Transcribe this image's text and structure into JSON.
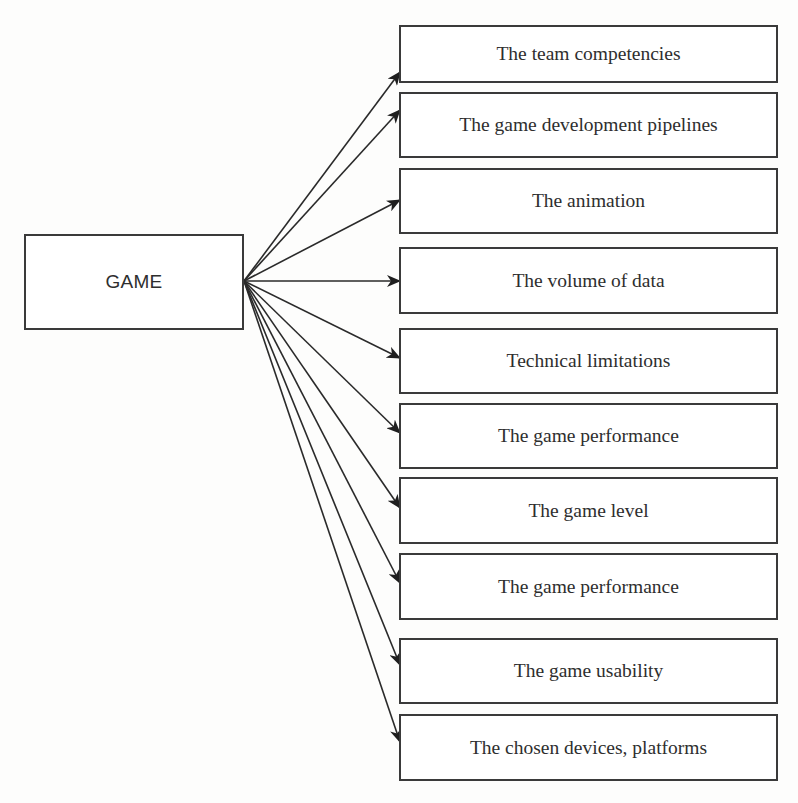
{
  "diagram": {
    "root": {
      "label": "GAME",
      "box": {
        "x": 24,
        "y": 234,
        "w": 220,
        "h": 96
      },
      "anchor": {
        "x": 244,
        "y": 281
      }
    },
    "leaves": [
      {
        "label": "The team competencies",
        "box": {
          "x": 399,
          "y": 25,
          "w": 379,
          "h": 58
        },
        "arrow_tip": {
          "x": 400,
          "y": 72
        }
      },
      {
        "label": "The game development pipelines",
        "box": {
          "x": 399,
          "y": 92,
          "w": 379,
          "h": 66
        },
        "arrow_tip": {
          "x": 400,
          "y": 110
        }
      },
      {
        "label": "The animation",
        "box": {
          "x": 399,
          "y": 168,
          "w": 379,
          "h": 66
        },
        "arrow_tip": {
          "x": 400,
          "y": 200
        }
      },
      {
        "label": "The volume of data",
        "box": {
          "x": 399,
          "y": 247,
          "w": 379,
          "h": 67
        },
        "arrow_tip": {
          "x": 400,
          "y": 281
        }
      },
      {
        "label": "Technical limitations",
        "box": {
          "x": 399,
          "y": 328,
          "w": 379,
          "h": 66
        },
        "arrow_tip": {
          "x": 400,
          "y": 358
        }
      },
      {
        "label": "The game performance",
        "box": {
          "x": 399,
          "y": 403,
          "w": 379,
          "h": 66
        },
        "arrow_tip": {
          "x": 400,
          "y": 433
        }
      },
      {
        "label": "The game level",
        "box": {
          "x": 399,
          "y": 477,
          "w": 379,
          "h": 67
        },
        "arrow_tip": {
          "x": 400,
          "y": 508
        }
      },
      {
        "label": "The game performance",
        "box": {
          "x": 399,
          "y": 553,
          "w": 379,
          "h": 67
        },
        "arrow_tip": {
          "x": 400,
          "y": 583
        }
      },
      {
        "label": "The game usability",
        "box": {
          "x": 399,
          "y": 638,
          "w": 379,
          "h": 66
        },
        "arrow_tip": {
          "x": 400,
          "y": 665
        }
      },
      {
        "label": "The chosen devices, platforms",
        "box": {
          "x": 399,
          "y": 714,
          "w": 379,
          "h": 67
        },
        "arrow_tip": {
          "x": 400,
          "y": 742
        }
      }
    ],
    "colors": {
      "stroke": "#2a2a2a",
      "text": "#2e2e2e",
      "background": "#fdfdfc"
    }
  }
}
